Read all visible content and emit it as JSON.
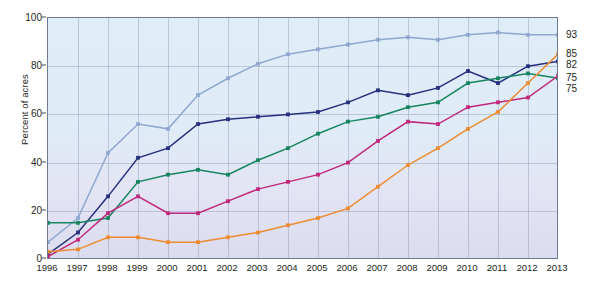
{
  "chart_data": {
    "type": "line",
    "title": "",
    "subtitle": "",
    "xlabel": "",
    "ylabel": "Percent of acres",
    "xlim": [
      1996,
      2013
    ],
    "ylim": [
      0,
      100
    ],
    "grid": true,
    "legend_position": "inline-annotations",
    "x": [
      1996,
      1997,
      1998,
      1999,
      2000,
      2001,
      2002,
      2003,
      2004,
      2005,
      2006,
      2007,
      2008,
      2009,
      2010,
      2011,
      2012,
      2013
    ],
    "xticklabels": [
      "1996",
      "1997",
      "1998",
      "1999",
      "2000",
      "2001",
      "2002",
      "2003",
      "2004",
      "2005",
      "2006",
      "2007",
      "2008",
      "2009",
      "2010",
      "2011",
      "2012",
      "2013"
    ],
    "yticklabels": [
      "0",
      "20",
      "40",
      "60",
      "80",
      "100"
    ],
    "yticks": [
      0,
      20,
      40,
      60,
      80,
      100
    ],
    "series": [
      {
        "name": "HT soybeans",
        "color": "#8fa8cf",
        "end_value": 93,
        "annotation": "HT soybeans",
        "values": [
          7,
          17,
          44,
          56,
          54,
          68,
          75,
          81,
          85,
          87,
          89,
          91,
          92,
          91,
          93,
          94,
          93,
          93
        ]
      },
      {
        "name": "HT cotton",
        "color": "#26307d",
        "end_value": 82,
        "annotation": "HT cotton",
        "values": [
          2,
          11,
          26,
          42,
          46,
          56,
          58,
          59,
          60,
          61,
          65,
          70,
          68,
          71,
          78,
          73,
          80,
          82
        ]
      },
      {
        "name": "Bt cotton",
        "color": "#17855f",
        "end_value": 75,
        "annotation": "Bt cotton",
        "values": [
          15,
          15,
          17,
          32,
          35,
          37,
          35,
          41,
          46,
          52,
          57,
          59,
          63,
          65,
          73,
          75,
          77,
          75
        ]
      },
      {
        "name": "Bt corn",
        "color": "#c0287c",
        "end_value": 75,
        "annotation": "Bt corn",
        "values": [
          1,
          8,
          19,
          26,
          19,
          19,
          24,
          29,
          32,
          35,
          40,
          49,
          57,
          56,
          63,
          65,
          67,
          76
        ]
      },
      {
        "name": "Ht corn",
        "color": "#ec8c31",
        "end_value": 85,
        "annotation": "Ht corn",
        "values": [
          3,
          4,
          9,
          9,
          7,
          7,
          9,
          11,
          14,
          17,
          21,
          30,
          39,
          46,
          54,
          61,
          73,
          85
        ]
      }
    ]
  }
}
